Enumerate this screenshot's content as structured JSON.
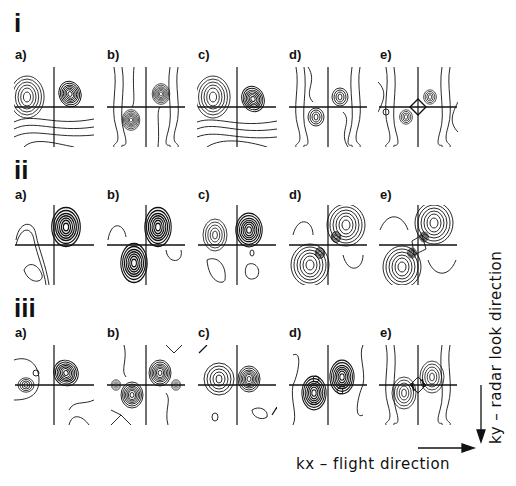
{
  "figure": {
    "rows": [
      {
        "id": "i",
        "label": "i",
        "panels": [
          {
            "label": "a)",
            "pattern": "quadrant-lobes-upper"
          },
          {
            "label": "b)",
            "pattern": "diagonal-pair"
          },
          {
            "label": "c)",
            "pattern": "quadrant-lobes-upper"
          },
          {
            "label": "d)",
            "pattern": "diagonal-pair-weak"
          },
          {
            "label": "e)",
            "pattern": "diffuse-diamond"
          }
        ]
      },
      {
        "id": "ii",
        "label": "ii",
        "panels": [
          {
            "label": "a)",
            "pattern": "single-lobe-upper-right"
          },
          {
            "label": "b)",
            "pattern": "diagonal-pair"
          },
          {
            "label": "c)",
            "pattern": "single-lobe-upper-right"
          },
          {
            "label": "d)",
            "pattern": "diagonal-pair-strong"
          },
          {
            "label": "e)",
            "pattern": "diagonal-pair-strong"
          }
        ]
      },
      {
        "id": "iii",
        "label": "iii",
        "panels": [
          {
            "label": "a)",
            "pattern": "single-lobe-upper-right"
          },
          {
            "label": "b)",
            "pattern": "diagonal-pair-with-side-lobes"
          },
          {
            "label": "c)",
            "pattern": "symmetric-pair-upper"
          },
          {
            "label": "d)",
            "pattern": "diagonal-pair-vertical"
          },
          {
            "label": "e)",
            "pattern": "diagonal-pair-vertical"
          }
        ]
      }
    ],
    "axes": {
      "x_label": "kx  –  flight direction",
      "y_label": "ky  –  radar look direction"
    },
    "colors": {
      "ink": "#111111",
      "background": "#ffffff"
    }
  }
}
